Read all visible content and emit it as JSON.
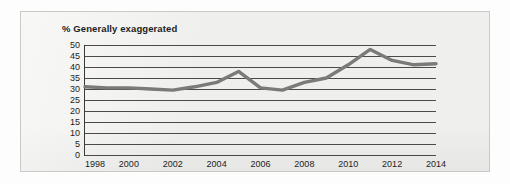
{
  "chart_data": {
    "type": "line",
    "title": "% Generally exaggerated",
    "xlabel": "",
    "ylabel": "",
    "xlim": [
      1998,
      2014
    ],
    "ylim": [
      0,
      50
    ],
    "grid": true,
    "legend": false,
    "y_ticks": [
      50,
      45,
      40,
      35,
      30,
      25,
      20,
      15,
      10,
      5,
      0
    ],
    "x_ticks": [
      1998,
      2000,
      2002,
      2004,
      2006,
      2008,
      2010,
      2012,
      2014
    ],
    "x": [
      1998,
      1999,
      2000,
      2001,
      2002,
      2003,
      2004,
      2005,
      2006,
      2007,
      2008,
      2009,
      2010,
      2011,
      2012,
      2013,
      2014
    ],
    "values": [
      31,
      30.5,
      30.5,
      30,
      29.5,
      31,
      33,
      38,
      30.5,
      29.5,
      33,
      35,
      41,
      48,
      43,
      41,
      41.5
    ],
    "series": [
      {
        "name": "% Generally exaggerated",
        "values": [
          31,
          30.5,
          30.5,
          30,
          29.5,
          31,
          33,
          38,
          30.5,
          29.5,
          33,
          35,
          41,
          48,
          43,
          41,
          41.5
        ]
      }
    ],
    "line_color": "#7a7a7a",
    "grid_color": "#4a4a4a",
    "background_color": "#efefed"
  }
}
